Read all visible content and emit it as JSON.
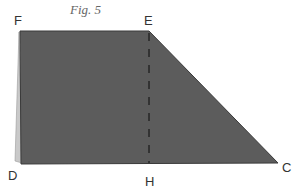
{
  "figure": {
    "caption": "Fig. 5",
    "shape": "trapezoid",
    "fill_color": "#5c5c5c",
    "sliver_color": "#c9c9c9",
    "edge_color": "#3a3a3a",
    "vertices": {
      "F": "F",
      "E": "E",
      "C": "C",
      "D": "D",
      "H": "H"
    },
    "dashed_segment": "EH"
  }
}
